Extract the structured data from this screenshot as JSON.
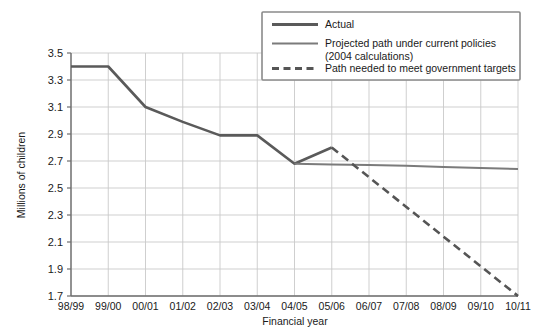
{
  "chart_data": {
    "type": "line",
    "title": "",
    "xlabel": "Financial year",
    "ylabel": "Millions of children",
    "categories": [
      "98/99",
      "99/00",
      "00/01",
      "01/02",
      "02/03",
      "03/04",
      "04/05",
      "05/06",
      "06/07",
      "07/08",
      "08/09",
      "09/10",
      "10/11"
    ],
    "ylim": [
      1.7,
      3.5
    ],
    "yticks": [
      "3.5",
      "3.3",
      "3.1",
      "2.9",
      "2.7",
      "2.5",
      "2.3",
      "2.1",
      "1.9",
      "1.7"
    ],
    "ytick_values": [
      3.5,
      3.3,
      3.1,
      2.9,
      2.7,
      2.5,
      2.3,
      2.1,
      1.9,
      1.7
    ],
    "grid": true,
    "legend_position": "top-right",
    "series": [
      {
        "name": "Actual",
        "style": "solid",
        "color": "#5a5a5a",
        "width": 2.6,
        "x": [
          "98/99",
          "99/00",
          "00/01",
          "01/02",
          "02/03",
          "03/04",
          "04/05",
          "05/06"
        ],
        "values": [
          3.4,
          3.4,
          3.1,
          2.99,
          2.89,
          2.89,
          2.68,
          2.8
        ]
      },
      {
        "name": "Projected path under current policies (2004 calculations)",
        "style": "solid",
        "color": "#7b7b7b",
        "width": 2.0,
        "x": [
          "04/05",
          "05/06",
          "06/07",
          "07/08",
          "08/09",
          "09/10",
          "10/11"
        ],
        "values": [
          2.68,
          2.675,
          2.67,
          2.665,
          2.655,
          2.648,
          2.64
        ]
      },
      {
        "name": "Path needed to meet government targets",
        "style": "dashed",
        "color": "#555555",
        "width": 2.6,
        "x": [
          "05/06",
          "10/11"
        ],
        "values": [
          2.8,
          1.7
        ]
      }
    ]
  },
  "legend": {
    "items": [
      {
        "label": "Actual",
        "swatch": "solid-thick",
        "color": "#5a5a5a"
      },
      {
        "label": "Projected path under current policies",
        "label2": "(2004 calculations)",
        "swatch": "solid-thin",
        "color": "#7b7b7b"
      },
      {
        "label": "Path needed to meet government targets",
        "swatch": "dashed",
        "color": "#555555"
      }
    ]
  },
  "axes": {
    "x_title": "Financial year",
    "y_title": "Millions of children"
  },
  "colors": {
    "grid": "#c9c9c9",
    "axis": "#6e6e6e",
    "actual": "#5a5a5a",
    "projected": "#7b7b7b",
    "target": "#555555",
    "legend_border": "#8a8a8a",
    "background": "#ffffff"
  }
}
